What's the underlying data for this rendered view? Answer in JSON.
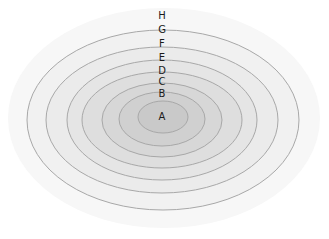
{
  "diagram": {
    "type": "nested-ellipses",
    "rings": [
      {
        "label": "H",
        "cx": 164,
        "cy": 118,
        "rx": 156,
        "ry": 110,
        "fill": "#f7f7f7",
        "label_x": 162,
        "label_y": 19
      },
      {
        "label": "G",
        "cx": 163,
        "cy": 120,
        "rx": 136,
        "ry": 90,
        "fill": "#f1f1f1",
        "label_x": 162,
        "label_y": 33
      },
      {
        "label": "F",
        "cx": 162,
        "cy": 120,
        "rx": 116,
        "ry": 73,
        "fill": "#ebebeb",
        "label_x": 162,
        "label_y": 47
      },
      {
        "label": "E",
        "cx": 162,
        "cy": 120,
        "rx": 95,
        "ry": 60,
        "fill": "#e5e5e5",
        "label_x": 162,
        "label_y": 61
      },
      {
        "label": "D",
        "cx": 162,
        "cy": 120,
        "rx": 80,
        "ry": 48,
        "fill": "#dedede",
        "label_x": 162,
        "label_y": 74
      },
      {
        "label": "C",
        "cx": 162,
        "cy": 120,
        "rx": 60,
        "ry": 37,
        "fill": "#d7d7d7",
        "label_x": 162,
        "label_y": 85
      },
      {
        "label": "B",
        "cx": 162,
        "cy": 119,
        "rx": 43,
        "ry": 27,
        "fill": "#d0d0d0",
        "label_x": 162,
        "label_y": 97
      },
      {
        "label": "A",
        "cx": 163,
        "cy": 117,
        "rx": 25,
        "ry": 16,
        "fill": "#c9c9c9",
        "label_x": 162,
        "label_y": 120
      }
    ],
    "stroke_color": "#a8a8a8",
    "label_color": "#1a1a1a"
  }
}
